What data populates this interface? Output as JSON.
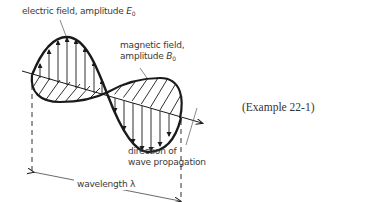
{
  "figure": {
    "labels": {
      "electric_field": "electric field, amplitude ",
      "electric_symbol": "E",
      "electric_sub": "0",
      "magnetic_line1": "magnetic field,",
      "magnetic_line2": "amplitude ",
      "magnetic_symbol": "B",
      "magnetic_sub": "0",
      "direction_line1": "direction of",
      "direction_line2": "wave propagation",
      "wavelength": "wavelength λ"
    },
    "caption": "(Example 22-1)",
    "colors": {
      "stroke": "#1a1a1a",
      "text": "#3a3a3a",
      "background": "#ffffff"
    }
  }
}
